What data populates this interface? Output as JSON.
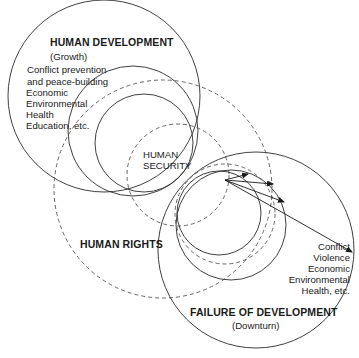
{
  "diagram": {
    "human_development": {
      "title": "HUMAN DEVELOPMENT",
      "subtitle": "(Growth)",
      "items": [
        "Conflict prevention",
        "and peace-building",
        "Economic",
        "Environmental",
        "Health",
        "Education, etc."
      ]
    },
    "human_security": {
      "line1": "HUMAN",
      "line2": "SECURITY"
    },
    "human_rights": {
      "title": "HUMAN RIGHTS"
    },
    "failure_of_development": {
      "title": "FAILURE OF DEVELOPMENT",
      "subtitle": "(Downturn)",
      "items": [
        "Conflict",
        "Violence",
        "Economic",
        "Environmental",
        "Health, etc."
      ]
    },
    "colors": {
      "line": "#2a2a2a",
      "dashed": "#555555",
      "background": "#ffffff"
    }
  }
}
